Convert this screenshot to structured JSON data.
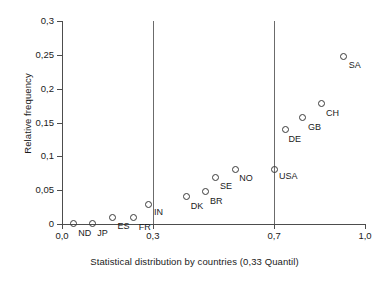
{
  "chart_data": {
    "type": "scatter",
    "title": "",
    "xlabel": "Statistical distribution by countries (0,33 Quantil)",
    "ylabel": "Relative frequency",
    "xlim": [
      0.0,
      1.0
    ],
    "ylim": [
      0.0,
      0.3
    ],
    "grid": false,
    "legend": "none",
    "x_ticks": [
      {
        "value": 0.0,
        "label": "0,0"
      },
      {
        "value": 0.3,
        "label": "0,3"
      },
      {
        "value": 0.7,
        "label": "0,7"
      },
      {
        "value": 1.0,
        "label": "1,0"
      }
    ],
    "y_ticks": [
      {
        "value": 0.0,
        "label": "0"
      },
      {
        "value": 0.05,
        "label": "0,05"
      },
      {
        "value": 0.1,
        "label": "0,1"
      },
      {
        "value": 0.15,
        "label": "0,15"
      },
      {
        "value": 0.2,
        "label": "0,2"
      },
      {
        "value": 0.25,
        "label": "0,25"
      },
      {
        "value": 0.3,
        "label": "0,3"
      }
    ],
    "reference_lines": [
      {
        "orientation": "vertical",
        "value": 0.3
      },
      {
        "orientation": "vertical",
        "value": 0.7
      }
    ],
    "points": [
      {
        "label": "ND",
        "x": 0.037,
        "y": 0.001,
        "label_dx": 5,
        "label_dy": 6
      },
      {
        "label": "JP",
        "x": 0.1,
        "y": 0.001,
        "label_dx": 5,
        "label_dy": 6
      },
      {
        "label": "ES",
        "x": 0.167,
        "y": 0.01,
        "label_dx": 5,
        "label_dy": 5
      },
      {
        "label": "FR",
        "x": 0.237,
        "y": 0.009,
        "label_dx": 5,
        "label_dy": 5
      },
      {
        "label": "IN",
        "x": 0.287,
        "y": 0.029,
        "label_dx": 5,
        "label_dy": 4
      },
      {
        "label": "DK",
        "x": 0.412,
        "y": 0.04,
        "label_dx": 4,
        "label_dy": 5
      },
      {
        "label": "BR",
        "x": 0.472,
        "y": 0.048,
        "label_dx": 5,
        "label_dy": 5
      },
      {
        "label": "SE",
        "x": 0.505,
        "y": 0.068,
        "label_dx": 5,
        "label_dy": 4
      },
      {
        "label": "NO",
        "x": 0.572,
        "y": 0.08,
        "label_dx": 4,
        "label_dy": 4
      },
      {
        "label": "USA",
        "x": 0.7,
        "y": 0.08,
        "label_dx": 5,
        "label_dy": 2
      },
      {
        "label": "DE",
        "x": 0.738,
        "y": 0.14,
        "label_dx": 3,
        "label_dy": 6
      },
      {
        "label": "GB",
        "x": 0.795,
        "y": 0.157,
        "label_dx": 5,
        "label_dy": 5
      },
      {
        "label": "CH",
        "x": 0.855,
        "y": 0.178,
        "label_dx": 5,
        "label_dy": 5
      },
      {
        "label": "SA",
        "x": 0.93,
        "y": 0.248,
        "label_dx": 5,
        "label_dy": 5
      }
    ]
  }
}
